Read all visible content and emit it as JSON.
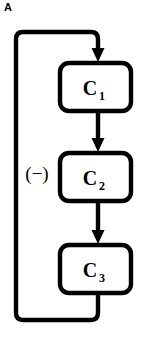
{
  "figure": {
    "panel_letter": "A",
    "background_color": "#ffffff",
    "stroke_color": "#000000",
    "node_fill_color": "#ffffff"
  },
  "diagram": {
    "type": "cyclic-feedback-loop",
    "feedback_sign_label": "(−)",
    "nodes": [
      {
        "id": "c1",
        "base": "C",
        "subscript": "1",
        "full_label": "C₁"
      },
      {
        "id": "c2",
        "base": "C",
        "subscript": "2",
        "full_label": "C₂"
      },
      {
        "id": "c3",
        "base": "C",
        "subscript": "3",
        "full_label": "C₃"
      }
    ],
    "edges": [
      {
        "id": "e-feedback-in",
        "from": "feedback",
        "to": "c1",
        "arrow": true
      },
      {
        "id": "e-c1-c2",
        "from": "c1",
        "to": "c2",
        "arrow": true
      },
      {
        "id": "e-c2-c3",
        "from": "c2",
        "to": "c3",
        "arrow": true
      },
      {
        "id": "e-c3-feedback",
        "from": "c3",
        "to": "feedback",
        "arrow": false
      }
    ]
  }
}
